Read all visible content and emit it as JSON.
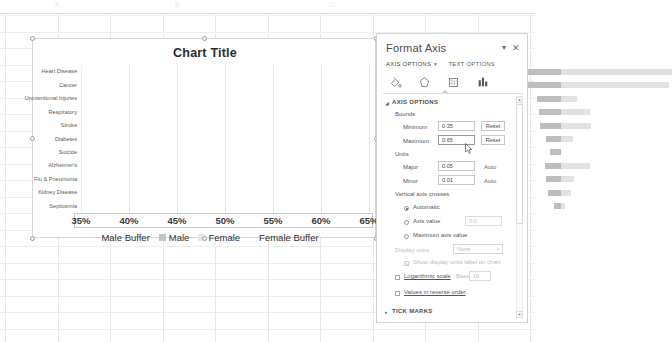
{
  "app": {
    "background": "spreadsheet"
  },
  "chart": {
    "title": "Chart Title",
    "axis_ticks": [
      "35%",
      "40%",
      "45%",
      "50%",
      "55%",
      "60%",
      "65%"
    ],
    "legend": [
      {
        "label": "Male Buffer",
        "swatch": "none"
      },
      {
        "label": "Male",
        "swatch": "male"
      },
      {
        "label": "Female",
        "swatch": "female"
      },
      {
        "label": "Female Buffer",
        "swatch": "none"
      }
    ]
  },
  "chart_data": {
    "type": "bar",
    "subtype": "stacked-horizontal-tornado",
    "title": "Chart Title",
    "xlabel": "",
    "ylabel": "",
    "xlim": [
      0.35,
      0.65
    ],
    "xtick_format": "percent",
    "xticks": [
      0.35,
      0.4,
      0.45,
      0.5,
      0.55,
      0.6,
      0.65
    ],
    "major_unit": 0.05,
    "minor_unit": 0.01,
    "grid": true,
    "legend_position": "bottom",
    "categories": [
      "Septicemia",
      "Kidney Disease",
      "Flu & Pneumonia",
      "Alzheimer's",
      "Suicide",
      "Diabetes",
      "Stroke",
      "Respiratory",
      "Unintentional Injuries",
      "Cancer",
      "Heart Disease"
    ],
    "series": [
      {
        "name": "Male Buffer",
        "visible": false,
        "values": [
          0.493,
          0.486,
          0.484,
          0.483,
          0.489,
          0.484,
          0.478,
          0.477,
          0.475,
          0.385,
          0.384
        ]
      },
      {
        "name": "Male",
        "color": "#bdbdbd",
        "values": [
          0.007,
          0.014,
          0.016,
          0.017,
          0.011,
          0.016,
          0.022,
          0.023,
          0.025,
          0.115,
          0.116
        ]
      },
      {
        "name": "Female",
        "color": "#e2e2e2",
        "values": [
          0.004,
          0.01,
          0.014,
          0.03,
          0.0,
          0.013,
          0.031,
          0.03,
          0.017,
          0.112,
          0.116
        ]
      },
      {
        "name": "Female Buffer",
        "visible": false,
        "values": [
          0.146,
          0.14,
          0.136,
          0.12,
          0.15,
          0.137,
          0.119,
          0.12,
          0.133,
          0.038,
          0.034
        ]
      }
    ]
  },
  "pane": {
    "title": "Format Axis",
    "dropdown_icon": "chevron-down-icon",
    "close_icon": "close-icon",
    "tabs": [
      {
        "label": "AXIS OPTIONS",
        "active": true,
        "caret": "▼"
      },
      {
        "label": "TEXT OPTIONS",
        "active": false
      }
    ],
    "icons": [
      {
        "name": "fill-and-line-icon",
        "selected": false
      },
      {
        "name": "effects-icon",
        "selected": false
      },
      {
        "name": "size-and-properties-icon",
        "selected": false
      },
      {
        "name": "axis-options-chart-icon",
        "selected": true
      }
    ],
    "sections": {
      "axis_options": {
        "header": "AXIS OPTIONS",
        "expanded": true,
        "arrow": "◢",
        "bounds": {
          "group_label": "Bounds",
          "minimum_label": "Minimum",
          "minimum_value": "0.35",
          "minimum_reset": "Reset",
          "maximum_label": "Maximum",
          "maximum_value": "0.65",
          "maximum_reset": "Reset"
        },
        "units": {
          "group_label": "Units",
          "major_label": "Major",
          "major_value": "0.05",
          "major_auto": "Auto",
          "minor_label": "Minor",
          "minor_value": "0.01",
          "minor_auto": "Auto"
        },
        "vertical_axis_crosses": {
          "group_label": "Vertical axis crosses",
          "options": [
            {
              "label": "Automatic",
              "selected": true,
              "mnemonic": "u"
            },
            {
              "label": "Axis value",
              "selected": false,
              "value": "0.0",
              "mnemonic": "x"
            },
            {
              "label": "Maximum axis value",
              "selected": false,
              "mnemonic": "M"
            }
          ]
        },
        "display_units": {
          "label": "Display units",
          "value": "None",
          "disabled": true,
          "show_label_checkbox": {
            "label": "Show display units label on chart",
            "checked": true,
            "disabled": true
          }
        },
        "logarithmic": {
          "label": "Logarithmic scale",
          "checked": false,
          "base_label": "Base",
          "base_value": "10"
        },
        "reverse_order": {
          "label": "Values in reverse order",
          "checked": false
        }
      },
      "tick_marks": {
        "header": "TICK MARKS",
        "expanded": false,
        "arrow": "▸"
      }
    },
    "scrollbar": {
      "up": "▲",
      "down": "▼"
    }
  },
  "colors": {
    "male_bar": "#bdbdbd",
    "female_bar": "#e2e2e2",
    "pane_border": "#d4d4d4",
    "chart_border": "#d6d6d6",
    "grid": "#e6e8ea"
  }
}
